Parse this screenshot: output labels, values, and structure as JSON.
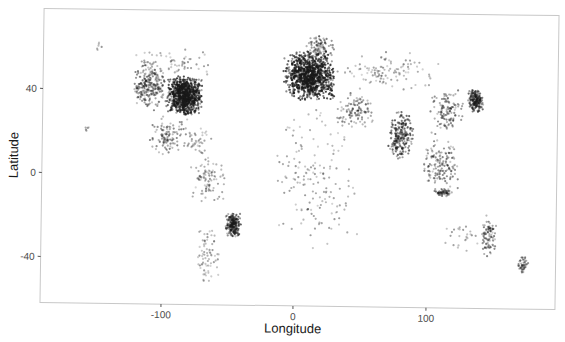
{
  "chart_data": {
    "type": "scatter",
    "title": "",
    "xlabel": "Longitude",
    "ylabel": "Latitude",
    "xlim": [
      -190,
      195
    ],
    "ylim": [
      -62,
      78
    ],
    "xticks": [
      -100,
      0,
      100
    ],
    "xtick_labels": [
      "-100",
      "0",
      "100"
    ],
    "yticks": [
      -40,
      0,
      40
    ],
    "ytick_labels": [
      "-40",
      "0",
      "40"
    ],
    "grid": false,
    "legend": null,
    "point_color": "#1a1a1a",
    "regions": [
      {
        "name": "Eastern USA",
        "lon": [
          -98,
          -70
        ],
        "lat": [
          28,
          47
        ],
        "n": 900,
        "density": "very high"
      },
      {
        "name": "Western USA / Canada",
        "lon": [
          -124,
          -98
        ],
        "lat": [
          30,
          55
        ],
        "n": 260,
        "density": "medium"
      },
      {
        "name": "Canada north",
        "lon": [
          -125,
          -60
        ],
        "lat": [
          47,
          60
        ],
        "n": 60,
        "density": "low"
      },
      {
        "name": "Alaska",
        "lon": [
          -155,
          -145
        ],
        "lat": [
          58,
          64
        ],
        "n": 6,
        "density": "low"
      },
      {
        "name": "Hawaii",
        "lon": [
          -159,
          -155
        ],
        "lat": [
          19,
          22
        ],
        "n": 5,
        "density": "low"
      },
      {
        "name": "Mexico / Central America",
        "lon": [
          -110,
          -80
        ],
        "lat": [
          8,
          28
        ],
        "n": 110,
        "density": "medium"
      },
      {
        "name": "Caribbean",
        "lon": [
          -85,
          -60
        ],
        "lat": [
          10,
          23
        ],
        "n": 40,
        "density": "low"
      },
      {
        "name": "Northern South America",
        "lon": [
          -80,
          -50
        ],
        "lat": [
          -15,
          10
        ],
        "n": 90,
        "density": "low"
      },
      {
        "name": "Brazil SE coast",
        "lon": [
          -52,
          -40
        ],
        "lat": [
          -30,
          -18
        ],
        "n": 200,
        "density": "high"
      },
      {
        "name": "Southern South America",
        "lon": [
          -73,
          -55
        ],
        "lat": [
          -55,
          -25
        ],
        "n": 70,
        "density": "low"
      },
      {
        "name": "Western / Central Europe",
        "lon": [
          -10,
          30
        ],
        "lat": [
          36,
          60
        ],
        "n": 1100,
        "density": "very high"
      },
      {
        "name": "Scandinavia",
        "lon": [
          5,
          30
        ],
        "lat": [
          56,
          68
        ],
        "n": 90,
        "density": "medium"
      },
      {
        "name": "Russia / Central Asia",
        "lon": [
          30,
          110
        ],
        "lat": [
          40,
          60
        ],
        "n": 110,
        "density": "low"
      },
      {
        "name": "Middle East",
        "lon": [
          30,
          60
        ],
        "lat": [
          22,
          40
        ],
        "n": 110,
        "density": "medium"
      },
      {
        "name": "Africa",
        "lon": [
          -17,
          50
        ],
        "lat": [
          -35,
          35
        ],
        "n": 160,
        "density": "low"
      },
      {
        "name": "India",
        "lon": [
          70,
          90
        ],
        "lat": [
          8,
          32
        ],
        "n": 220,
        "density": "high"
      },
      {
        "name": "China / Korea",
        "lon": [
          100,
          128
        ],
        "lat": [
          20,
          42
        ],
        "n": 120,
        "density": "medium"
      },
      {
        "name": "Japan",
        "lon": [
          130,
          142
        ],
        "lat": [
          31,
          43
        ],
        "n": 180,
        "density": "high"
      },
      {
        "name": "SE Asia",
        "lon": [
          95,
          125
        ],
        "lat": [
          -8,
          20
        ],
        "n": 150,
        "density": "medium"
      },
      {
        "name": "Indonesia / Java",
        "lon": [
          105,
          120
        ],
        "lat": [
          -9,
          -5
        ],
        "n": 60,
        "density": "medium"
      },
      {
        "name": "Australia east",
        "lon": [
          140,
          154
        ],
        "lat": [
          -38,
          -16
        ],
        "n": 90,
        "density": "medium"
      },
      {
        "name": "Australia west/south",
        "lon": [
          114,
          140
        ],
        "lat": [
          -35,
          -20
        ],
        "n": 25,
        "density": "low"
      },
      {
        "name": "New Zealand",
        "lon": [
          168,
          178
        ],
        "lat": [
          -46,
          -36
        ],
        "n": 45,
        "density": "medium"
      }
    ]
  }
}
